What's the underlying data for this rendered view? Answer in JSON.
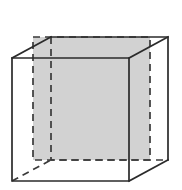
{
  "figure": {
    "description": "A wireframe cube drawn in oblique projection. Visible edges are solid black lines; hidden edges are dashed. A square cross-section plane parallel to the front face is shaded light gray and outlined with dashed lines.",
    "background_color": "#ffffff",
    "width": 182,
    "height": 190
  },
  "style": {
    "solid_edge_color": "#2b2b2b",
    "hidden_edge_color": "#3a3a3a",
    "shade_fill_color": "#d2d2d2",
    "stroke_width": 1.7,
    "dash_pattern": "7 5"
  },
  "geometry": {
    "projection": "oblique",
    "depth_offset_x": 39,
    "depth_offset_y": -21,
    "front_face": {
      "label": "front-face",
      "top_left": [
        12,
        58
      ],
      "top_right": [
        129,
        58
      ],
      "bottom_right": [
        129,
        181
      ],
      "bottom_left": [
        12,
        181
      ],
      "points": "12,58 129,58 129,181 12,181",
      "style": "solid"
    },
    "back_face": {
      "label": "back-face",
      "top_left": [
        51,
        37
      ],
      "top_right": [
        168,
        37
      ],
      "bottom_right": [
        168,
        160
      ],
      "bottom_left": [
        51,
        160
      ],
      "points": "51,37 168,37 168,160 51,160",
      "style": "mixed"
    },
    "back_visible_path": "51,37 168,37 168,160",
    "back_hidden_path": "51,37 51,160 168,160",
    "connectors": [
      {
        "name": "connector-top-left",
        "from": [
          12,
          58
        ],
        "to": [
          51,
          37
        ],
        "style": "solid",
        "path": "M12,58 L51,37"
      },
      {
        "name": "connector-top-right",
        "from": [
          129,
          58
        ],
        "to": [
          168,
          37
        ],
        "style": "solid",
        "path": "M129,58 L168,37"
      },
      {
        "name": "connector-bottom-right",
        "from": [
          129,
          181
        ],
        "to": [
          168,
          160
        ],
        "style": "solid",
        "path": "M129,181 L168,160"
      },
      {
        "name": "connector-bottom-left",
        "from": [
          12,
          181
        ],
        "to": [
          51,
          160
        ],
        "style": "hidden",
        "path": "M12,181 L51,160"
      }
    ],
    "cross_section": {
      "label": "shaded-cross-section",
      "description": "Square plane parallel to the front face, located partway into the cube depth",
      "top_left": [
        33,
        37
      ],
      "top_right": [
        150,
        37
      ],
      "bottom_right": [
        150,
        160
      ],
      "bottom_left": [
        33,
        160
      ],
      "points": "33,37 150,37 150,160 33,160",
      "fill": "#d2d2d2",
      "outline_style": "dashed"
    }
  }
}
